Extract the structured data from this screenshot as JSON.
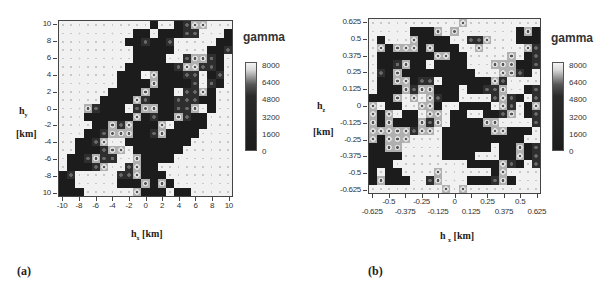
{
  "chart_data": [
    {
      "type": "heatmap",
      "panel_label": "(a)",
      "title": "",
      "xlabel": "h_x [km]",
      "ylabel": "h_y [km]",
      "xlim": [
        -10,
        10
      ],
      "ylim": [
        10,
        -10
      ],
      "x_ticks": [
        "-10",
        "-8",
        "-6",
        "-4",
        "-2",
        "0",
        "2",
        "4",
        "6",
        "8",
        "10"
      ],
      "y_ticks": [
        "10",
        "8",
        "6",
        "4",
        "2",
        "0",
        "-2",
        "-4",
        "-6",
        "-8",
        "10"
      ],
      "legend": {
        "title": "gamma",
        "ticks": [
          "8000",
          "6400",
          "4800",
          "3200",
          "1600",
          "0"
        ],
        "range": [
          0,
          8000
        ]
      },
      "grid_size": [
        21,
        21
      ],
      "value_encoding": {
        "0": "0-1600 (dark)",
        "1": "3200-4800",
        "2": "4800-6400",
        "3": "6400-8000 (light)"
      },
      "grid": [
        "333333333330330122333",
        "333333333003000113330",
        "333333330010013333300",
        "333333333000003333001",
        "333333333000033122103",
        "333333330000001221103",
        "333333300032000113013",
        "333333300002000013103",
        "333333000020003112033",
        "333330000210001110033",
        "333210003122001123033",
        "333000000201002100333",
        "333300212000230000333",
        "333001222001200003333",
        "330012330000000033333",
        "330001223000000333333",
        "300121133200003333333",
        "300012331200333333333",
        "013333311200033333333",
        "003333300020203333333",
        "000333333200030033333"
      ]
    },
    {
      "type": "heatmap",
      "panel_label": "(b)",
      "title": "",
      "xlabel": "h_x [km]",
      "ylabel": "h_z [km]",
      "xlim": [
        -0.625,
        0.625
      ],
      "ylim": [
        -0.625,
        0.625
      ],
      "x_ticks_upper": [
        "-0.5",
        "-0.25",
        "0",
        "0.25",
        "0.5"
      ],
      "x_ticks_lower": [
        "-0.625",
        "-0.375",
        "-0.125",
        "0.125",
        "0.375",
        "0.625"
      ],
      "y_ticks": [
        "0.625",
        "0.5",
        "0.375",
        "0.25",
        "0.125",
        "0",
        "-0.125",
        "-0.25",
        "-0.375",
        "-0.5",
        "-0.625"
      ],
      "legend": {
        "title": "gamma",
        "ticks": [
          "8000",
          "6400",
          "4800",
          "3200",
          "1600",
          "0"
        ],
        "range": [
          0,
          8000
        ]
      },
      "grid_size": [
        21,
        21
      ],
      "value_encoding": {
        "0": "0-1600 (dark)",
        "1": "3200-4800",
        "2": "4800-6400",
        "3": "6400-8000 (light)"
      },
      "grid": [
        "333333333332333333333",
        "333330002323333333020",
        "303332000033112333000",
        "320222020003323333321",
        "300000002200333332301",
        "300120030000333222001",
        "310200000000033322103",
        "300220113000000213333",
        "300021220003001123301",
        "000232321003333121031",
        "230033220330000321302",
        "202300322300330012301",
        "202000212300002233331",
        "222221223000000220003",
        "202223333000000000033",
        "002233333000000300201",
        "000033333000033300201",
        "000333333333000021031",
        "030033332333333023333",
        "020003312333000120333",
        "333333333232333333333"
      ]
    }
  ],
  "panels": {
    "a": {
      "label": "(a)",
      "ylabel_main": "h",
      "ylabel_sub": "y",
      "yunit": "[km]",
      "xlabel_main": "h",
      "xlabel_sub": "x",
      "xunit": "[km]",
      "legend_title": "gamma"
    },
    "b": {
      "label": "(b)",
      "ylabel_main": "h",
      "ylabel_sub": "z",
      "yunit": "[km]",
      "xlabel_main": "h",
      "xlabel_sub": "x",
      "xunit": "[km]",
      "legend_title": "gamma"
    }
  }
}
